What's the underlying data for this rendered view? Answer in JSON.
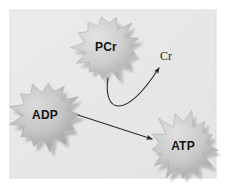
{
  "figure": {
    "background_color": "#ffffff",
    "panel_color": "#e9e9e9",
    "panel_edge_color": "#dedede"
  },
  "nodes": [
    {
      "id": "pcr",
      "label": "PCr",
      "shape": "starburst",
      "cx": 106,
      "cy": 47,
      "radius_outer": 33,
      "radius_inner": 22,
      "points": 13,
      "rotation": -8,
      "fill_light": "#d8d8d8",
      "fill_dark": "#a8a8a8",
      "shadow_color": "#9a9a9a",
      "text_color": "#131313"
    },
    {
      "id": "adp",
      "label": "ADP",
      "shape": "starburst",
      "cx": 45,
      "cy": 115,
      "radius_outer": 35,
      "radius_inner": 23,
      "points": 13,
      "rotation": 6,
      "fill_light": "#cfcfcf",
      "fill_dark": "#9d9d9d",
      "shadow_color": "#909090",
      "text_color": "#131313"
    },
    {
      "id": "atp",
      "label": "ATP",
      "shape": "starburst",
      "cx": 183,
      "cy": 146,
      "radius_outer": 34,
      "radius_inner": 22,
      "points": 13,
      "rotation": 14,
      "fill_light": "#d5d5d5",
      "fill_dark": "#a4a4a4",
      "shadow_color": "#969696",
      "text_color": "#131313"
    }
  ],
  "free_labels": [
    {
      "id": "cr",
      "text": "Cr",
      "x": 166,
      "y": 56,
      "color": "#2a2a2a"
    }
  ],
  "arrows": [
    {
      "id": "pcr-to-cr",
      "from": "PCr",
      "to": "Cr",
      "type": "curved",
      "color": "#2b2b2b",
      "width": 1.1,
      "start": [
        108,
        78
      ],
      "control_1": [
        103,
        112
      ],
      "control_2": [
        124,
        122
      ],
      "end": [
        159,
        68
      ],
      "head_angle_deg": -63
    },
    {
      "id": "adp-to-atp",
      "from": "ADP",
      "to": "ATP",
      "type": "straight",
      "color": "#2b2b2b",
      "width": 1.1,
      "start": [
        78,
        115
      ],
      "end": [
        152,
        139
      ],
      "head_angle_deg": 18
    }
  ]
}
